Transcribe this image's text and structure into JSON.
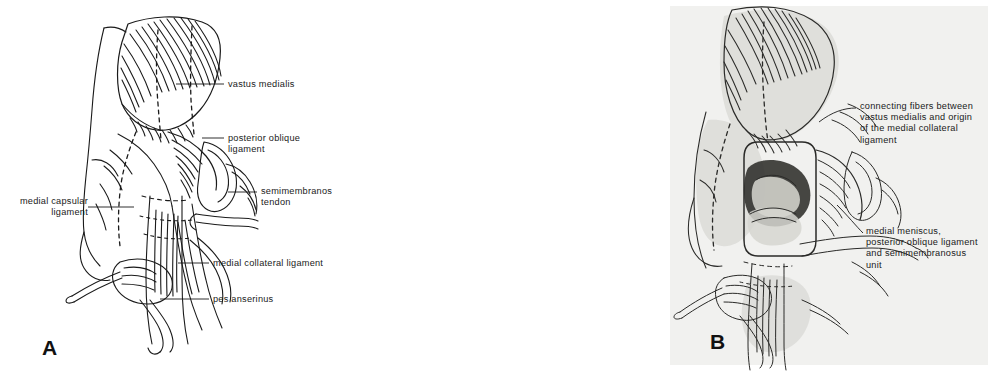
{
  "figure": {
    "type": "anatomical-illustration",
    "panel_count": 2,
    "background_color": "#ffffff",
    "photo_background_color": "#f1f1ef",
    "ink_color": "#1a1a1a"
  },
  "panel_a": {
    "letter": "A",
    "kind": "line-drawing",
    "labels": [
      {
        "id": "vastus-medialis",
        "text": "vastus medialis",
        "align": "left",
        "x": 228,
        "y": 80
      },
      {
        "id": "posterior-oblique-ligament",
        "text": "posterior oblique ligament",
        "align": "left",
        "x": 228,
        "y": 134
      },
      {
        "id": "medial-capsular-ligament",
        "text": "medial capsular\nligament",
        "align": "right",
        "x": 10,
        "y": 198
      },
      {
        "id": "semimembranosus-tendon",
        "text": "semimembranosus\ntendon",
        "align": "left",
        "x": 261,
        "y": 188
      },
      {
        "id": "medial-collateral-ligament",
        "text": "medial collateral ligament",
        "align": "left",
        "x": 213,
        "y": 259
      },
      {
        "id": "pes-anserinus",
        "text": "pes anserinus",
        "align": "left",
        "x": 213,
        "y": 295
      }
    ]
  },
  "panel_b": {
    "letter": "B",
    "kind": "photograph",
    "labels": [
      {
        "id": "connecting-fibers",
        "text": "connecting fibers between\nvastus medialis and origin\nof the medial collateral\nligament",
        "align": "left",
        "x": 528,
        "y": 104
      },
      {
        "id": "medial-meniscus-unit",
        "text": "medial meniscus,\nposterior oblique ligament\nand semimembranosus\nunit",
        "align": "left",
        "x": 534,
        "y": 228
      }
    ]
  }
}
